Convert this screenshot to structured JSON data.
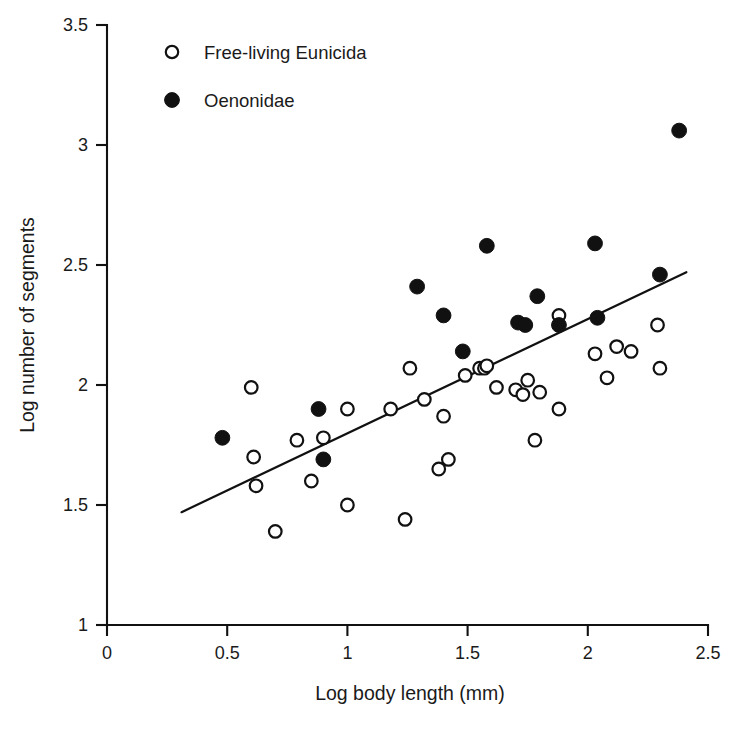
{
  "chart_data": {
    "type": "scatter",
    "title": "",
    "xlabel": "Log body length (mm)",
    "ylabel": "Log number of segments",
    "xlim": [
      0,
      2.5
    ],
    "ylim": [
      1,
      3.5
    ],
    "xticks": [
      0,
      0.5,
      1,
      1.5,
      2,
      2.5
    ],
    "xticklabels": [
      "0",
      "0.5",
      "1",
      "1.5",
      "2",
      "2.5"
    ],
    "yticks": [
      1,
      1.5,
      2,
      2.5,
      3,
      3.5
    ],
    "yticklabels": [
      "1",
      "1.5",
      "2",
      "2.5",
      "3",
      "3.5"
    ],
    "grid": false,
    "legend_position": "upper left",
    "marker_color": "#111111",
    "series": [
      {
        "name": "Free-living Eunicida",
        "marker": "open-circle",
        "points": [
          [
            0.6,
            1.99
          ],
          [
            0.61,
            1.7
          ],
          [
            0.62,
            1.58
          ],
          [
            0.7,
            1.39
          ],
          [
            0.79,
            1.77
          ],
          [
            0.85,
            1.6
          ],
          [
            0.9,
            1.78
          ],
          [
            1.0,
            1.5
          ],
          [
            1.0,
            1.9
          ],
          [
            1.18,
            1.9
          ],
          [
            1.24,
            1.44
          ],
          [
            1.26,
            2.07
          ],
          [
            1.32,
            1.94
          ],
          [
            1.38,
            1.65
          ],
          [
            1.4,
            1.87
          ],
          [
            1.42,
            1.69
          ],
          [
            1.49,
            2.04
          ],
          [
            1.55,
            2.07
          ],
          [
            1.57,
            2.07
          ],
          [
            1.58,
            2.08
          ],
          [
            1.62,
            1.99
          ],
          [
            1.7,
            1.98
          ],
          [
            1.73,
            1.96
          ],
          [
            1.75,
            2.02
          ],
          [
            1.78,
            1.77
          ],
          [
            1.8,
            1.97
          ],
          [
            1.88,
            1.9
          ],
          [
            1.88,
            2.29
          ],
          [
            2.03,
            2.13
          ],
          [
            2.08,
            2.03
          ],
          [
            2.12,
            2.16
          ],
          [
            2.18,
            2.14
          ],
          [
            2.29,
            2.25
          ],
          [
            2.3,
            2.07
          ]
        ]
      },
      {
        "name": "Oenonidae",
        "marker": "filled-circle",
        "points": [
          [
            0.48,
            1.78
          ],
          [
            0.88,
            1.9
          ],
          [
            0.9,
            1.69
          ],
          [
            1.29,
            2.41
          ],
          [
            1.4,
            2.29
          ],
          [
            1.48,
            2.14
          ],
          [
            1.58,
            2.58
          ],
          [
            1.71,
            2.26
          ],
          [
            1.74,
            2.25
          ],
          [
            1.79,
            2.37
          ],
          [
            1.88,
            2.25
          ],
          [
            2.03,
            2.59
          ],
          [
            2.04,
            2.28
          ],
          [
            2.3,
            2.46
          ],
          [
            2.38,
            3.06
          ]
        ]
      }
    ],
    "fit_line": {
      "name": "regression-line",
      "x_start": 0.31,
      "y_start": 1.47,
      "x_end": 2.41,
      "y_end": 2.47
    }
  },
  "legend": {
    "items": [
      {
        "label": "Free-living Eunicida",
        "marker": "open-circle"
      },
      {
        "label": "Oenonidae",
        "marker": "filled-circle"
      }
    ]
  },
  "caption": {
    "text": ""
  }
}
